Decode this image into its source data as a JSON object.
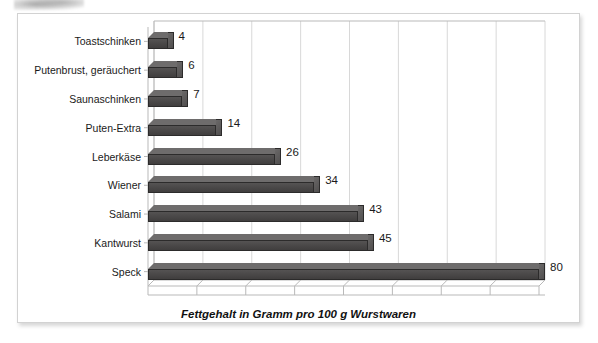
{
  "chart_data": {
    "type": "bar",
    "orientation": "horizontal",
    "title": "",
    "xlabel": "Fettgehalt in Gramm pro 100 g Wurstwaren",
    "ylabel": "",
    "categories": [
      "Toastschinken",
      "Putenbrust, geräuchert",
      "Saunaschinken",
      "Puten-Extra",
      "Leberkäse",
      "Wiener",
      "Salami",
      "Kantwurst",
      "Speck"
    ],
    "values": [
      4,
      6,
      7,
      14,
      26,
      34,
      43,
      45,
      80
    ],
    "data_labels": [
      "4",
      "6",
      "7",
      "14",
      "26",
      "34",
      "43",
      "45",
      "80"
    ],
    "xlim": [
      0,
      80
    ],
    "gridline_interval": 10,
    "gridlines": [
      0,
      10,
      20,
      30,
      40,
      50,
      60,
      70,
      80
    ],
    "grid": true,
    "legend": false,
    "style_3d": true,
    "bar_color": "#4b4949",
    "bar_top_color": "#6e6c6c",
    "bar_edge_color": "#2c2b2b",
    "grid_color": "#d8d8d8",
    "axis_color": "#b9b9b9",
    "text_color": "#1a1a1a",
    "panel_background": "#ffffff",
    "panel_border_color": "#d2d2d2"
  }
}
